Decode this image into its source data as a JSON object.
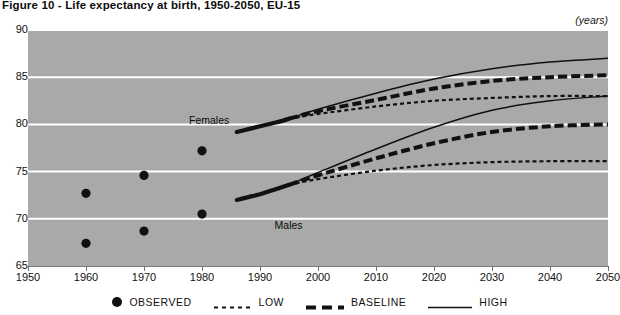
{
  "title": "Figure 10 - Life expectancy at birth, 1950-2050, EU-15",
  "units_label": "(years)",
  "series_labels": {
    "females": "Females",
    "males": "Males"
  },
  "legend": {
    "items": [
      {
        "key": "observed",
        "label": "OBSERVED",
        "icon": "filled-circle-marker"
      },
      {
        "key": "low",
        "label": "LOW",
        "icon": "dotted-line-swatch"
      },
      {
        "key": "baseline",
        "label": "BASELINE",
        "icon": "dashed-thick-line-swatch"
      },
      {
        "key": "high",
        "label": "HIGH",
        "icon": "solid-line-swatch"
      }
    ]
  },
  "colors": {
    "plot_background": "#a9a9a9",
    "gridline": "#ffffff",
    "ink": "#111111",
    "page_background": "#ffffff"
  },
  "chart_data": {
    "type": "line",
    "title": "Figure 10 - Life expectancy at birth, 1950-2050, EU-15",
    "xlabel": "",
    "ylabel": "(years)",
    "xlim": [
      1950,
      2050
    ],
    "ylim": [
      65,
      90
    ],
    "xticks": [
      1950,
      1960,
      1970,
      1980,
      1990,
      2000,
      2010,
      2020,
      2030,
      2040,
      2050
    ],
    "yticks": [
      65,
      70,
      75,
      80,
      85,
      90
    ],
    "grid": "horizontal",
    "legend_position": "bottom",
    "annotations": [
      {
        "text": "Females",
        "x": 1985,
        "y": 80.4
      },
      {
        "text": "Males",
        "x": 1992,
        "y": 69.2
      }
    ],
    "series": [
      {
        "name": "Females OBSERVED",
        "group": "Females",
        "scenario": "observed",
        "style": "marker",
        "x": [
          1960,
          1970,
          1980
        ],
        "values": [
          72.7,
          74.6,
          77.2
        ]
      },
      {
        "name": "Males OBSERVED",
        "group": "Males",
        "scenario": "observed",
        "style": "marker",
        "x": [
          1960,
          1970,
          1980
        ],
        "values": [
          67.4,
          68.7,
          70.5
        ]
      },
      {
        "name": "Females HISTORIC",
        "group": "Females",
        "scenario": "historic",
        "style": "thick-solid",
        "x": [
          1986,
          1988,
          1990,
          1992,
          1994,
          1995
        ],
        "values": [
          79.2,
          79.5,
          79.8,
          80.1,
          80.4,
          80.6
        ]
      },
      {
        "name": "Males HISTORIC",
        "group": "Males",
        "scenario": "historic",
        "style": "thick-solid",
        "x": [
          1986,
          1988,
          1990,
          1992,
          1994,
          1995
        ],
        "values": [
          72.0,
          72.3,
          72.6,
          73.0,
          73.4,
          73.6
        ]
      },
      {
        "name": "Females HIGH",
        "group": "Females",
        "scenario": "high",
        "style": "solid",
        "x": [
          1995,
          2000,
          2010,
          2020,
          2030,
          2040,
          2050
        ],
        "values": [
          80.6,
          81.6,
          83.3,
          84.8,
          85.9,
          86.6,
          87.0
        ]
      },
      {
        "name": "Females BASELINE",
        "group": "Females",
        "scenario": "baseline",
        "style": "dashed-thick",
        "x": [
          1995,
          2000,
          2010,
          2020,
          2030,
          2040,
          2050
        ],
        "values": [
          80.6,
          81.4,
          82.6,
          83.8,
          84.6,
          85.0,
          85.2
        ]
      },
      {
        "name": "Females LOW",
        "group": "Females",
        "scenario": "low",
        "style": "dotted",
        "x": [
          1995,
          2000,
          2010,
          2020,
          2030,
          2040,
          2050
        ],
        "values": [
          80.6,
          81.1,
          81.9,
          82.5,
          82.8,
          83.0,
          83.0
        ]
      },
      {
        "name": "Males HIGH",
        "group": "Males",
        "scenario": "high",
        "style": "solid",
        "x": [
          1995,
          2000,
          2010,
          2020,
          2030,
          2040,
          2050
        ],
        "values": [
          73.6,
          74.9,
          77.4,
          79.7,
          81.5,
          82.5,
          83.0
        ]
      },
      {
        "name": "Males BASELINE",
        "group": "Males",
        "scenario": "baseline",
        "style": "dashed-thick",
        "x": [
          1995,
          2000,
          2010,
          2020,
          2030,
          2040,
          2050
        ],
        "values": [
          73.6,
          74.6,
          76.4,
          78.0,
          79.2,
          79.8,
          80.0
        ]
      },
      {
        "name": "Males LOW",
        "group": "Males",
        "scenario": "low",
        "style": "dotted",
        "x": [
          1995,
          2000,
          2010,
          2020,
          2030,
          2040,
          2050
        ],
        "values": [
          73.6,
          74.2,
          75.1,
          75.7,
          76.0,
          76.1,
          76.1
        ]
      }
    ]
  }
}
